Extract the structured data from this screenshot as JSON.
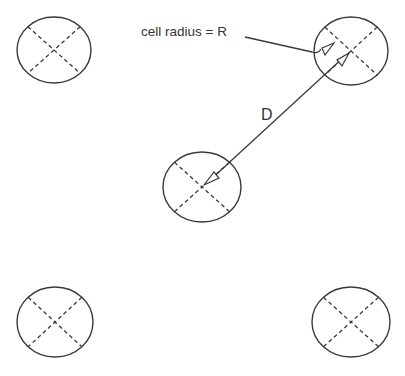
{
  "diagram": {
    "type": "cellular reuse distance",
    "labels": {
      "cell_radius": "cell radius = R",
      "distance": "D"
    },
    "cells": [
      {
        "name": "top-left",
        "cx": 54,
        "cy": 50,
        "rx": 37,
        "ry": 33
      },
      {
        "name": "top-right",
        "cx": 351,
        "cy": 51,
        "rx": 37,
        "ry": 34
      },
      {
        "name": "center",
        "cx": 202,
        "cy": 187,
        "rx": 39,
        "ry": 35
      },
      {
        "name": "bottom-left",
        "cx": 55,
        "cy": 322,
        "rx": 38,
        "ry": 35
      },
      {
        "name": "bottom-right",
        "cx": 351,
        "cy": 322,
        "rx": 39,
        "ry": 35
      }
    ],
    "colors": {
      "stroke": "#3a3a3a",
      "text": "#333333",
      "background": "#ffffff"
    }
  }
}
